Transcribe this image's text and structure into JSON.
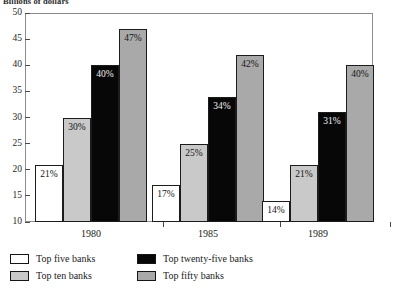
{
  "chart_data": {
    "type": "bar",
    "title": "",
    "ylabel": "Billions of dollars",
    "xlabel": "",
    "ylim": [
      10,
      50
    ],
    "yticks": [
      10,
      15,
      20,
      25,
      30,
      35,
      40,
      45,
      50
    ],
    "ytick_labels": [
      "10",
      "15",
      "20",
      "25",
      "30",
      "35",
      "40",
      "45",
      "50"
    ],
    "grid": false,
    "legend_position": "below",
    "categories": [
      "1980",
      "1985",
      "1989"
    ],
    "series": [
      {
        "name": "Top five banks",
        "color": "#ffffff",
        "values": [
          21,
          17,
          14
        ],
        "labels": [
          "21%",
          "17%",
          "14%"
        ]
      },
      {
        "name": "Top ten banks",
        "color": "#c9c9c9",
        "values": [
          30,
          25,
          21
        ],
        "labels": [
          "30%",
          "25%",
          "21%"
        ]
      },
      {
        "name": "Top twenty-five banks",
        "color": "#070707",
        "values": [
          40,
          34,
          31
        ],
        "labels": [
          "40%",
          "34%",
          "31%"
        ]
      },
      {
        "name": "Top fifty banks",
        "color": "#a9a9a9",
        "values": [
          47,
          42,
          40
        ],
        "labels": [
          "47%",
          "42%",
          "40%"
        ]
      }
    ]
  },
  "axis": {
    "ylabel": "Billions of dollars",
    "yticks": [
      "50",
      "45",
      "40",
      "35",
      "30",
      "25",
      "20",
      "15",
      "10"
    ],
    "xcategories": [
      "1980",
      "1985",
      "1989"
    ]
  },
  "legend": {
    "items": [
      {
        "label": "Top five banks",
        "swatch": "fill-white"
      },
      {
        "label": "Top twenty-five banks",
        "swatch": "fill-black"
      },
      {
        "label": "Top ten banks",
        "swatch": "fill-ltgray"
      },
      {
        "label": "Top fifty banks",
        "swatch": "fill-gray"
      }
    ]
  }
}
